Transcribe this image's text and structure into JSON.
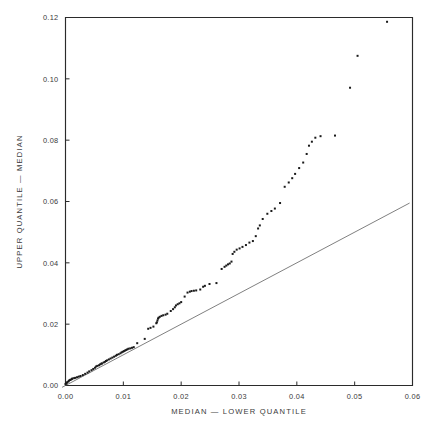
{
  "chart_data": {
    "type": "scatter",
    "title": "",
    "subtitle": "",
    "xlabel": "MEDIAN  —  LOWER QUANTILE",
    "ylabel": "UPPER QUANTILE  —  MEDIAN",
    "xlim": [
      0.0,
      0.06
    ],
    "ylim": [
      0.0,
      0.12
    ],
    "xticks": [
      0.0,
      0.01,
      0.02,
      0.03,
      0.04,
      0.05,
      0.06
    ],
    "xtick_labels": [
      "0.00",
      "0.01",
      "0.02",
      "0.03",
      "0.04",
      "0.05",
      "0.06"
    ],
    "yticks": [
      0.0,
      0.02,
      0.04,
      0.06,
      0.08,
      0.1,
      0.12
    ],
    "ytick_labels": [
      "0.00",
      "0.02",
      "0.04",
      "0.06",
      "0.08",
      "0.10",
      "0.12"
    ],
    "grid": false,
    "legend": null,
    "legend_position": "none",
    "marker": "small-filled-square",
    "marker_color": "#1a1a1a",
    "marker_size_px": 2.0,
    "reference_line": {
      "name": "y = x identity line",
      "type": "line",
      "color": "#555555",
      "width_px": 0.75,
      "x": [
        -0.0006,
        0.0595
      ],
      "y": [
        -0.0006,
        0.0595
      ]
    },
    "series": [
      {
        "name": "quantile pairs",
        "points": [
          [
            0.0,
            0.0005
          ],
          [
            0.0001,
            0.0006
          ],
          [
            0.0002,
            0.0008
          ],
          [
            0.0003,
            0.0011
          ],
          [
            0.0005,
            0.0013
          ],
          [
            0.0006,
            0.0016
          ],
          [
            0.0008,
            0.0018
          ],
          [
            0.0009,
            0.0019
          ],
          [
            0.0011,
            0.0021
          ],
          [
            0.0012,
            0.0023
          ],
          [
            0.0015,
            0.0024
          ],
          [
            0.0017,
            0.0025
          ],
          [
            0.002,
            0.0027
          ],
          [
            0.0023,
            0.0029
          ],
          [
            0.0026,
            0.0031
          ],
          [
            0.003,
            0.0034
          ],
          [
            0.0034,
            0.0038
          ],
          [
            0.0038,
            0.0042
          ],
          [
            0.0041,
            0.0046
          ],
          [
            0.0045,
            0.005
          ],
          [
            0.0048,
            0.0054
          ],
          [
            0.0051,
            0.0058
          ],
          [
            0.0053,
            0.0062
          ],
          [
            0.0055,
            0.0064
          ],
          [
            0.0058,
            0.0066
          ],
          [
            0.006,
            0.0069
          ],
          [
            0.0062,
            0.0071
          ],
          [
            0.0063,
            0.0072
          ],
          [
            0.0066,
            0.0075
          ],
          [
            0.0068,
            0.0077
          ],
          [
            0.007,
            0.008
          ],
          [
            0.0072,
            0.0082
          ],
          [
            0.0075,
            0.0085
          ],
          [
            0.0078,
            0.0088
          ],
          [
            0.0081,
            0.0091
          ],
          [
            0.0084,
            0.0094
          ],
          [
            0.0087,
            0.0097
          ],
          [
            0.0089,
            0.01
          ],
          [
            0.0092,
            0.0102
          ],
          [
            0.0095,
            0.0105
          ],
          [
            0.0097,
            0.0108
          ],
          [
            0.0099,
            0.011
          ],
          [
            0.0101,
            0.0112
          ],
          [
            0.0103,
            0.0114
          ],
          [
            0.0105,
            0.0116
          ],
          [
            0.0107,
            0.0118
          ],
          [
            0.0109,
            0.012
          ],
          [
            0.0112,
            0.0121
          ],
          [
            0.0115,
            0.0123
          ],
          [
            0.0118,
            0.0125
          ],
          [
            0.0124,
            0.0138
          ],
          [
            0.0137,
            0.0152
          ],
          [
            0.0143,
            0.0185
          ],
          [
            0.0147,
            0.0188
          ],
          [
            0.0152,
            0.0192
          ],
          [
            0.0157,
            0.0203
          ],
          [
            0.0158,
            0.0206
          ],
          [
            0.0159,
            0.0212
          ],
          [
            0.016,
            0.0218
          ],
          [
            0.0161,
            0.0221
          ],
          [
            0.0163,
            0.0224
          ],
          [
            0.0166,
            0.0227
          ],
          [
            0.0169,
            0.0229
          ],
          [
            0.0173,
            0.0231
          ],
          [
            0.0176,
            0.0234
          ],
          [
            0.0182,
            0.0243
          ],
          [
            0.0186,
            0.0249
          ],
          [
            0.0189,
            0.0255
          ],
          [
            0.0191,
            0.0261
          ],
          [
            0.0194,
            0.0265
          ],
          [
            0.0197,
            0.0268
          ],
          [
            0.02,
            0.0272
          ],
          [
            0.0206,
            0.029
          ],
          [
            0.0211,
            0.0303
          ],
          [
            0.0215,
            0.0306
          ],
          [
            0.0218,
            0.0308
          ],
          [
            0.0222,
            0.0309
          ],
          [
            0.0226,
            0.031
          ],
          [
            0.0233,
            0.0313
          ],
          [
            0.0238,
            0.0322
          ],
          [
            0.0241,
            0.0325
          ],
          [
            0.0249,
            0.0331
          ],
          [
            0.0261,
            0.0334
          ],
          [
            0.027,
            0.038
          ],
          [
            0.0275,
            0.0387
          ],
          [
            0.0278,
            0.0391
          ],
          [
            0.0281,
            0.0395
          ],
          [
            0.0284,
            0.0398
          ],
          [
            0.0287,
            0.0404
          ],
          [
            0.0289,
            0.0429
          ],
          [
            0.0292,
            0.0436
          ],
          [
            0.0296,
            0.0443
          ],
          [
            0.0301,
            0.0447
          ],
          [
            0.0306,
            0.0452
          ],
          [
            0.0312,
            0.0458
          ],
          [
            0.0318,
            0.0466
          ],
          [
            0.0324,
            0.0471
          ],
          [
            0.0329,
            0.0487
          ],
          [
            0.0333,
            0.0512
          ],
          [
            0.0336,
            0.0522
          ],
          [
            0.0341,
            0.0543
          ],
          [
            0.0349,
            0.056
          ],
          [
            0.0356,
            0.0569
          ],
          [
            0.0362,
            0.0577
          ],
          [
            0.0371,
            0.0595
          ],
          [
            0.0379,
            0.0648
          ],
          [
            0.0386,
            0.0662
          ],
          [
            0.0392,
            0.0676
          ],
          [
            0.0397,
            0.069
          ],
          [
            0.0404,
            0.0709
          ],
          [
            0.0411,
            0.0727
          ],
          [
            0.0417,
            0.0755
          ],
          [
            0.0421,
            0.0782
          ],
          [
            0.0426,
            0.0795
          ],
          [
            0.0432,
            0.0808
          ],
          [
            0.0441,
            0.0813
          ],
          [
            0.0466,
            0.0815
          ],
          [
            0.0492,
            0.0971
          ],
          [
            0.0505,
            0.1075
          ],
          [
            0.0556,
            0.1186
          ]
        ]
      }
    ]
  }
}
